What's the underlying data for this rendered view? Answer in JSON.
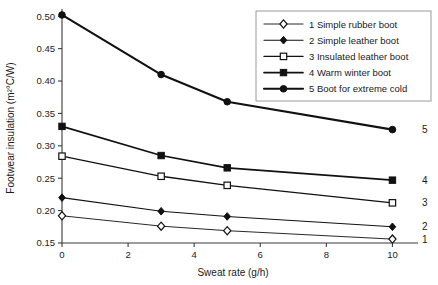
{
  "chart_data": {
    "type": "line",
    "title": "",
    "xlabel": "Sweat rate (g/h)",
    "ylabel": "Footwear insulation (m²°C/W)",
    "x": [
      0,
      3,
      5,
      10
    ],
    "xlim": [
      0,
      10.35
    ],
    "ylim": [
      0.15,
      0.505
    ],
    "xticks": [
      0,
      2,
      4,
      6,
      8,
      10
    ],
    "xtick_labels": [
      "0",
      "2",
      "4",
      "6",
      "8",
      "10"
    ],
    "yticks": [
      0.15,
      0.2,
      0.25,
      0.3,
      0.35,
      0.4,
      0.45,
      0.5
    ],
    "ytick_labels": [
      "0.15",
      "0.20",
      "0.25",
      "0.30",
      "0.35",
      "0.40",
      "0.45",
      "0.50"
    ],
    "grid": false,
    "legend_position": "top-right",
    "series": [
      {
        "name": "1 Simple rubber boot",
        "number": "1",
        "values": [
          0.192,
          0.176,
          0.169,
          0.156
        ],
        "marker": "diamond-open",
        "line_width": 0.9,
        "color": "#111111"
      },
      {
        "name": "2 Simple leather boot",
        "number": "2",
        "values": [
          0.22,
          0.199,
          0.191,
          0.175
        ],
        "marker": "diamond-filled",
        "line_width": 1.1,
        "color": "#111111"
      },
      {
        "name": "3 Insulated leather boot",
        "number": "3",
        "values": [
          0.284,
          0.253,
          0.239,
          0.212
        ],
        "marker": "square-open",
        "line_width": 1.3,
        "color": "#111111"
      },
      {
        "name": "4 Warm winter boot",
        "number": "4",
        "values": [
          0.33,
          0.285,
          0.266,
          0.247
        ],
        "marker": "square-filled",
        "line_width": 1.7,
        "color": "#111111"
      },
      {
        "name": "5 Boot for extreme cold",
        "number": "5",
        "values": [
          0.502,
          0.41,
          0.368,
          0.325
        ],
        "marker": "circle-filled",
        "line_width": 2.1,
        "color": "#111111"
      }
    ]
  },
  "legend": {
    "items": [
      "1 Simple rubber boot",
      "2 Simple leather boot",
      "3 Insulated leather boot",
      "4 Warm winter boot",
      "5 Boot for extreme cold"
    ]
  },
  "end_labels": [
    "1",
    "2",
    "3",
    "4",
    "5"
  ],
  "colors": {
    "background": "#ffffff",
    "ink": "#111111",
    "axis": "#3a3a3a",
    "legend_border": "#9a9a9a"
  }
}
